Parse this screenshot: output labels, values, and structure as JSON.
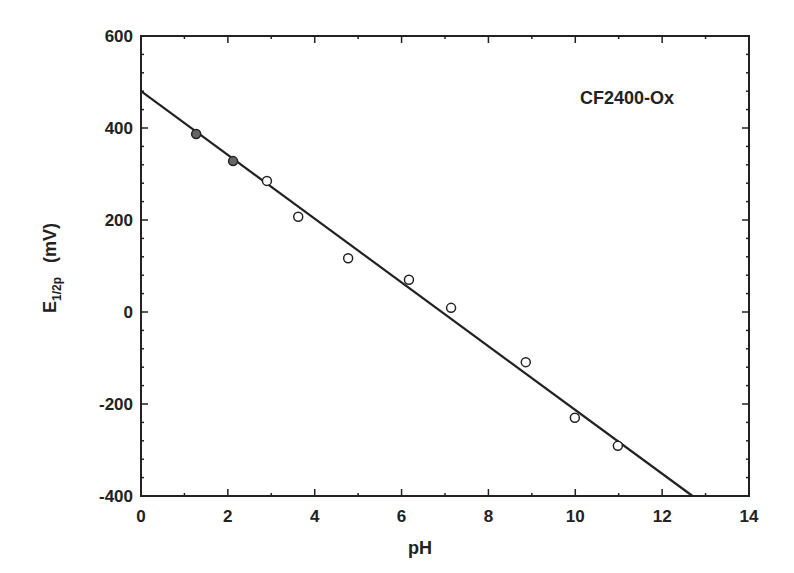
{
  "chart_data": {
    "type": "scatter",
    "title": "",
    "annotation": "CF2400-Ox",
    "xlabel": "pH",
    "ylabel": "E",
    "ylabel_sub": "1/2p",
    "ylabel_unit": "(mV)",
    "xlim": [
      0,
      14
    ],
    "ylim": [
      -400,
      600
    ],
    "xticks": [
      0,
      2,
      4,
      6,
      8,
      10,
      12,
      14
    ],
    "yticks": [
      -400,
      -200,
      0,
      200,
      400,
      600
    ],
    "grid": false,
    "legend": null,
    "series": [
      {
        "name": "CF2400-Ox data",
        "marker": "open-circle",
        "points": [
          {
            "x": 1.27,
            "y": 387
          },
          {
            "x": 2.12,
            "y": 328
          },
          {
            "x": 2.9,
            "y": 285
          },
          {
            "x": 3.62,
            "y": 207
          },
          {
            "x": 4.77,
            "y": 117
          },
          {
            "x": 6.17,
            "y": 70
          },
          {
            "x": 7.14,
            "y": 9
          },
          {
            "x": 8.86,
            "y": -109
          },
          {
            "x": 9.99,
            "y": -230
          },
          {
            "x": 10.98,
            "y": -291
          }
        ]
      },
      {
        "name": "linear fit",
        "type": "line",
        "points": [
          {
            "x": 0,
            "y": 480
          },
          {
            "x": 12.7,
            "y": -400
          }
        ]
      }
    ]
  },
  "colors": {
    "ink": "#222222",
    "background": "#ffffff"
  }
}
